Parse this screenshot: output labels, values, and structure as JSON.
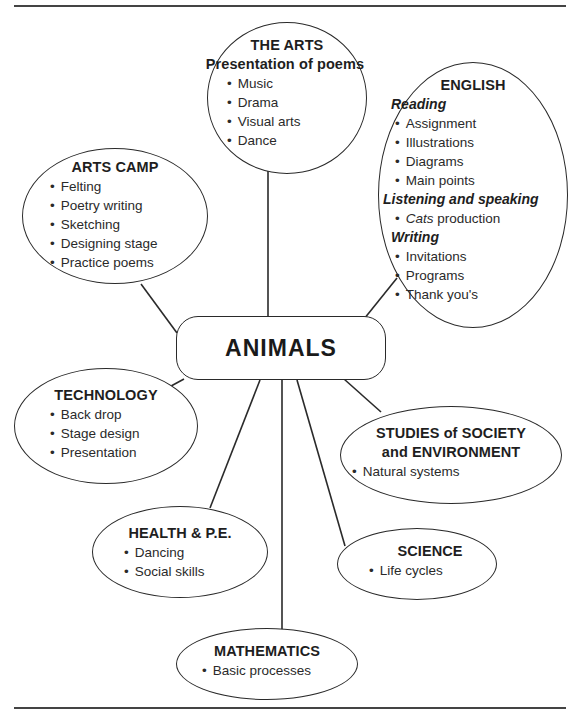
{
  "diagram": {
    "type": "concept map",
    "top_fragment": "...g p...",
    "center": {
      "label": "ANIMALS"
    },
    "nodes": {
      "the_arts": {
        "title": "THE ARTS",
        "subtitle": "Presentation of poems",
        "items": [
          "Music",
          "Drama",
          "Visual arts",
          "Dance"
        ]
      },
      "english": {
        "title": "ENGLISH",
        "sections": [
          {
            "heading": "Reading",
            "items": [
              "Assignment",
              "Illustrations",
              "Diagrams",
              "Main points"
            ]
          },
          {
            "heading": "Listening and speaking",
            "items": [
              {
                "italic": "Cats",
                "rest": " production"
              }
            ]
          },
          {
            "heading": "Writing",
            "items": [
              "Invitations",
              "Programs",
              "Thank you's"
            ]
          }
        ]
      },
      "arts_camp": {
        "title": "ARTS CAMP",
        "items": [
          "Felting",
          "Poetry writing",
          "Sketching",
          "Designing stage",
          "Practice poems"
        ]
      },
      "technology": {
        "title": "TECHNOLOGY",
        "items": [
          "Back drop",
          "Stage design",
          "Presentation"
        ]
      },
      "sose": {
        "title_line1": "STUDIES of SOCIETY",
        "title_line2": "and ENVIRONMENT",
        "items": [
          "Natural systems"
        ]
      },
      "health_pe": {
        "title": "HEALTH & P.E.",
        "items": [
          "Dancing",
          "Social skills"
        ]
      },
      "science": {
        "title": "SCIENCE",
        "items": [
          "Life cycles"
        ]
      },
      "mathematics": {
        "title": "MATHEMATICS",
        "items": [
          "Basic processes"
        ]
      }
    },
    "colors": {
      "line": "#2a2a2a",
      "text": "#1e1e1e",
      "background": "#ffffff"
    }
  }
}
